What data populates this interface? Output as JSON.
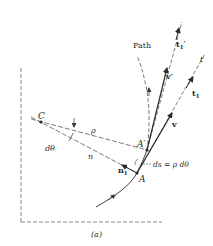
{
  "figure": {
    "caption": "(a)",
    "labels": {
      "path": "Path",
      "center": "C",
      "point_a": "A",
      "point_a_prime": "A′",
      "rho": "ρ",
      "normal": "n",
      "dtheta": "dθ",
      "n1": "n",
      "n1_sub": "1",
      "t_axis": "t",
      "t1": "t",
      "t1_sub": "1",
      "t1_prime": "t",
      "t1_prime_sub": "1",
      "t1_prime_mark": "′",
      "v": "v",
      "v_prime": "v′",
      "ds_eq": "ds = ρ dθ"
    },
    "colors": {
      "ink": "#2a2a2a",
      "dash": "#6a6a6a",
      "background": "#ffffff"
    }
  }
}
